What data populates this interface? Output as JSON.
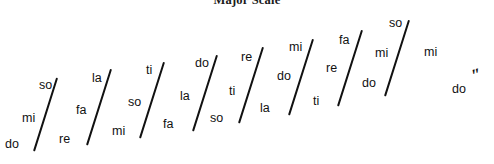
{
  "figure": {
    "title": "Major Scale",
    "title_clipped": true,
    "width": 494,
    "height": 164,
    "background_color": "#ffffff",
    "ink_color": "#111111",
    "final_octave_mark": "″"
  },
  "chart_data": {
    "type": "diagram",
    "title": "Major Scale",
    "groups": [
      {
        "index": 1,
        "syllables": [
          "do",
          "mi",
          "so"
        ],
        "slash": {
          "x1": 33,
          "y1": 151,
          "x2": 56,
          "y2": 78
        }
      },
      {
        "index": 2,
        "syllables": [
          "re",
          "fa",
          "la"
        ],
        "slash": {
          "x1": 86,
          "y1": 145,
          "x2": 110,
          "y2": 69
        }
      },
      {
        "index": 3,
        "syllables": [
          "mi",
          "so",
          "ti"
        ],
        "slash": {
          "x1": 139,
          "y1": 138,
          "x2": 163,
          "y2": 62
        }
      },
      {
        "index": 4,
        "syllables": [
          "fa",
          "la",
          "do"
        ],
        "slash": {
          "x1": 192,
          "y1": 131,
          "x2": 216,
          "y2": 55
        }
      },
      {
        "index": 5,
        "syllables": [
          "so",
          "ti",
          "re"
        ],
        "slash": {
          "x1": 238,
          "y1": 123,
          "x2": 262,
          "y2": 47
        }
      },
      {
        "index": 6,
        "syllables": [
          "la",
          "do",
          "mi"
        ],
        "slash": {
          "x1": 288,
          "y1": 115,
          "x2": 312,
          "y2": 39
        }
      },
      {
        "index": 7,
        "syllables": [
          "ti",
          "re",
          "fa"
        ],
        "slash": {
          "x1": 337,
          "y1": 106,
          "x2": 361,
          "y2": 30
        }
      },
      {
        "index": 8,
        "syllables": [
          "do",
          "mi",
          "so"
        ],
        "slash": {
          "x1": 384,
          "y1": 96,
          "x2": 408,
          "y2": 20
        }
      }
    ],
    "labels": [
      {
        "id": "l1",
        "text": "do",
        "x": 5,
        "y": 138
      },
      {
        "id": "l2",
        "text": "mi",
        "x": 22,
        "y": 112
      },
      {
        "id": "l3",
        "text": "so",
        "x": 39,
        "y": 79
      },
      {
        "id": "l4",
        "text": "re",
        "x": 59,
        "y": 133
      },
      {
        "id": "l5",
        "text": "fa",
        "x": 76,
        "y": 104
      },
      {
        "id": "l6",
        "text": "la",
        "x": 92,
        "y": 72
      },
      {
        "id": "l7",
        "text": "mi",
        "x": 112,
        "y": 125
      },
      {
        "id": "l8",
        "text": "so",
        "x": 128,
        "y": 96
      },
      {
        "id": "l9",
        "text": "ti",
        "x": 146,
        "y": 64
      },
      {
        "id": "l10",
        "text": "fa",
        "x": 163,
        "y": 118
      },
      {
        "id": "l11",
        "text": "la",
        "x": 180,
        "y": 90
      },
      {
        "id": "l12",
        "text": "do",
        "x": 195,
        "y": 57
      },
      {
        "id": "l13",
        "text": "so",
        "x": 210,
        "y": 112
      },
      {
        "id": "l14",
        "text": "ti",
        "x": 229,
        "y": 85
      },
      {
        "id": "l15",
        "text": "re",
        "x": 241,
        "y": 51
      },
      {
        "id": "l16",
        "text": "la",
        "x": 260,
        "y": 102
      },
      {
        "id": "l17",
        "text": "do",
        "x": 277,
        "y": 70
      },
      {
        "id": "l18",
        "text": "mi",
        "x": 289,
        "y": 41
      },
      {
        "id": "l19",
        "text": "ti",
        "x": 313,
        "y": 95
      },
      {
        "id": "l20",
        "text": "re",
        "x": 326,
        "y": 62
      },
      {
        "id": "l21",
        "text": "fa",
        "x": 339,
        "y": 34
      },
      {
        "id": "l22",
        "text": "do",
        "x": 362,
        "y": 77
      },
      {
        "id": "l23",
        "text": "mi",
        "x": 375,
        "y": 47
      },
      {
        "id": "l24",
        "text": "so",
        "x": 389,
        "y": 17
      },
      {
        "id": "l25",
        "text": "mi",
        "x": 424,
        "y": 46
      },
      {
        "id": "l26",
        "text": "do",
        "x": 452,
        "y": 83
      }
    ],
    "octave_marks": [
      {
        "id": "m1",
        "text": "″",
        "x": 472,
        "y": 66,
        "rotation": -18
      }
    ]
  }
}
